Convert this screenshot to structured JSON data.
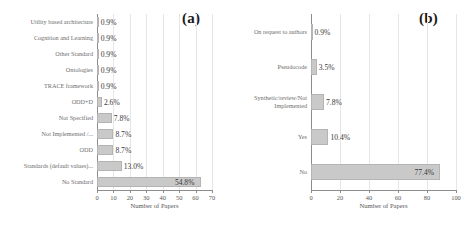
{
  "figure": {
    "background": "#ffffff",
    "bar_color": "#c9c9c9",
    "bar_edge_color": "#b4b4b4",
    "grid_color": "#e6e6e6",
    "axis_color": "#8c8c8c"
  },
  "panels": [
    {
      "tag": "(a)",
      "xlabel": "Number of Papers",
      "ticks": [
        "0",
        "10",
        "20",
        "30",
        "40",
        "50",
        "60",
        "70"
      ]
    },
    {
      "tag": "(b)",
      "xlabel": "Number of Papers",
      "ticks": [
        "0",
        "20",
        "40",
        "60",
        "80",
        "100"
      ]
    }
  ],
  "chart_data": [
    {
      "type": "bar",
      "orientation": "horizontal",
      "title": "(a)",
      "xlabel": "Number of Papers",
      "ylabel": "",
      "xlim": [
        0,
        70
      ],
      "xticks": [
        0,
        10,
        20,
        30,
        40,
        50,
        60,
        70
      ],
      "grid": true,
      "legend": "none",
      "categories": [
        "Utility based architecture",
        "Cognition and Learning",
        "Other Standard",
        "Ontologies",
        "TRACE framework",
        "ODD+D",
        "Not Specified",
        "Not Implemented /...",
        "ODD",
        "Standards (default values)...",
        "No Standard"
      ],
      "values": [
        1,
        1,
        1,
        1,
        1,
        3,
        9,
        10,
        10,
        15,
        63
      ],
      "data_labels": [
        "0.9%",
        "0.9%",
        "0.9%",
        "0.9%",
        "0.9%",
        "2.6%",
        "7.8%",
        "8.7%",
        "8.7%",
        "13.0%",
        "54.8%"
      ],
      "percentages": [
        0.9,
        0.9,
        0.9,
        0.9,
        0.9,
        2.6,
        7.8,
        8.7,
        8.7,
        13.0,
        54.8
      ]
    },
    {
      "type": "bar",
      "orientation": "horizontal",
      "title": "(b)",
      "xlabel": "Number of Papers",
      "ylabel": "",
      "xlim": [
        0,
        100
      ],
      "xticks": [
        0,
        20,
        40,
        60,
        80,
        100
      ],
      "grid": true,
      "legend": "none",
      "categories": [
        "On request to authors",
        "Pseudocode",
        "Synthetic/review/Not Implemented",
        "Yes",
        "No"
      ],
      "values": [
        1,
        4,
        9,
        12,
        89
      ],
      "data_labels": [
        "0.9%",
        "3.5%",
        "7.8%",
        "10.4%",
        "77.4%"
      ],
      "percentages": [
        0.9,
        3.5,
        7.8,
        10.4,
        77.4
      ]
    }
  ]
}
